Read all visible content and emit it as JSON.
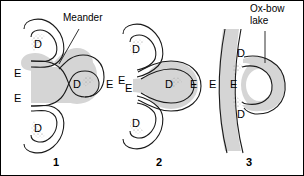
{
  "figure": {
    "title_text": "",
    "background_color": "#ffffff",
    "line_color": "#1a1a1a",
    "water_fill_color": "#d5d5d5",
    "stipple_color": "#7a7a7a",
    "border_color": "#000000"
  },
  "callouts": {
    "meander": "Meander",
    "oxbow_line1": "Ox-bow",
    "oxbow_line2": "lake"
  },
  "labels": {
    "erosion": "E",
    "deposition": "D"
  },
  "panels": [
    {
      "number": "1",
      "caption": "",
      "erosion_labels": [
        "E",
        "E",
        "E"
      ],
      "deposition_labels": [
        "D",
        "D",
        "D"
      ]
    },
    {
      "number": "2",
      "caption": "",
      "erosion_labels": [
        "E",
        "E",
        "E"
      ],
      "deposition_labels": [
        "D",
        "D",
        "D"
      ]
    },
    {
      "number": "3",
      "caption": "",
      "erosion_labels": [
        "E",
        "E"
      ],
      "deposition_labels": [
        "D",
        "D"
      ]
    }
  ]
}
